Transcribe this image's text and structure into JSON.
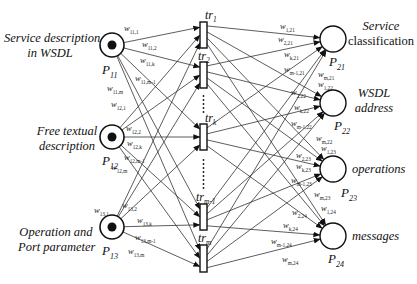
{
  "diagram": {
    "type": "petri-net",
    "colors": {
      "stroke": "#111111",
      "token": "#111111",
      "background": "#ffffff"
    },
    "input_places": [
      {
        "id": "P11",
        "base": "P",
        "sub": "11",
        "desc_lines": [
          "Service description",
          "in WSDL"
        ],
        "cx": 112,
        "cy": 45,
        "token": true
      },
      {
        "id": "P12",
        "base": "P",
        "sub": "12",
        "desc_lines": [
          "Free textual",
          "description"
        ],
        "cx": 112,
        "cy": 137,
        "token": true
      },
      {
        "id": "P13",
        "base": "P",
        "sub": "13",
        "desc_lines": [
          "Operation and",
          "Port parameter"
        ],
        "cx": 112,
        "cy": 227,
        "token": true
      }
    ],
    "transitions": [
      {
        "id": "tr1",
        "base": "tr",
        "sub": "1",
        "x": 200,
        "y": 22,
        "h": 26
      },
      {
        "id": "tr2",
        "base": "tr",
        "sub": "2",
        "x": 200,
        "y": 62,
        "h": 26
      },
      {
        "id": "trk",
        "base": "tr",
        "sub": "k",
        "x": 200,
        "y": 124,
        "h": 26
      },
      {
        "id": "trm-1",
        "base": "tr",
        "sub": "m-1",
        "x": 200,
        "y": 204,
        "h": 26
      },
      {
        "id": "trm",
        "base": "tr",
        "sub": "m",
        "x": 200,
        "y": 245,
        "h": 27
      }
    ],
    "output_places": [
      {
        "id": "P21",
        "base": "P",
        "sub": "21",
        "desc_lines": [
          "Service",
          "classification"
        ],
        "cx": 333,
        "cy": 39
      },
      {
        "id": "P22",
        "base": "P",
        "sub": "22",
        "desc_lines": [
          "WSDL",
          "address"
        ],
        "cx": 333,
        "cy": 103
      },
      {
        "id": "P23",
        "base": "P",
        "sub": "23",
        "desc_lines": [
          "operations"
        ],
        "cx": 333,
        "cy": 169
      },
      {
        "id": "P24",
        "base": "P",
        "sub": "24",
        "desc_lines": [
          "messages"
        ],
        "cx": 333,
        "cy": 236
      }
    ],
    "input_weights": {
      "P11": [
        "w11,1",
        "w11,2",
        "w11,k",
        "w11,m-1",
        "w11,m"
      ],
      "P12": [
        "w12,1",
        "w12,2",
        "w12,k",
        "w12,m-1",
        "w12,m"
      ],
      "P13": [
        "w13,1",
        "w13,2",
        "w13,k",
        "w13,m-1",
        "w13,m"
      ]
    },
    "output_weights": {
      "P21": [
        "w1,21",
        "w2,21",
        "wk,21",
        "wm-1,21",
        "wm,21"
      ],
      "P22": [
        "w1,22",
        "w2,22",
        "wk,22",
        "wm-1,22",
        "wm,22"
      ],
      "P23": [
        "w1,23",
        "w2,23",
        "wk,23",
        "wm-1,23",
        "wm,23"
      ],
      "P24": [
        "w1,24",
        "w2,24",
        "wk,24",
        "wm-1,24",
        "wm,24"
      ]
    },
    "ellipsis": "⋮"
  },
  "labels": {
    "p11_desc_1": "Service description",
    "p11_desc_2": "in WSDL",
    "p12_desc_1": "Free textual",
    "p12_desc_2": "description",
    "p13_desc_1": "Operation and",
    "p13_desc_2": "Port parameter",
    "p21_desc_1": "Service",
    "p21_desc_2": "classification",
    "p22_desc_1": "WSDL",
    "p22_desc_2": "address",
    "p23_desc_1": "operations",
    "p24_desc_1": "messages",
    "P": "P",
    "tr": "tr",
    "w": "w",
    "sub": {
      "11": "11",
      "12": "12",
      "13": "13",
      "21": "21",
      "22": "22",
      "23": "23",
      "24": "24",
      "t1": "1",
      "t2": "2",
      "tk": "k",
      "tm1": "m-1",
      "tm": "m",
      "w11_1": "11,1",
      "w11_2": "11,2",
      "w11_k": "11,k",
      "w11_m1": "11,m-1",
      "w11_m": "11,m",
      "w12_1": "12,1",
      "w12_2": "12,2",
      "w12_k": "12,k",
      "w12_m1": "12,m-1",
      "w12_m": "12,m",
      "w13_1": "13,1",
      "w13_2": "13,2",
      "w13_k": "13,k",
      "w13_m1": "13,m-1",
      "w13_m": "13,m",
      "w1_21": "1,21",
      "w2_21": "2,21",
      "wk_21": "k,21",
      "wm1_21": "m-1,21",
      "wm_21": "m,21",
      "w1_22": "1,22",
      "w2_22": "2,22",
      "wk_22": "k,22",
      "wm1_22": "m-1,22",
      "wm_22": "m,22",
      "w1_23": "1,23",
      "w2_23": "2,23",
      "wk_23": "k,23",
      "wm1_23": "m-1,23",
      "wm_23": "m,23",
      "w1_24": "1,24",
      "w2_24": "2,24",
      "wk_24": "k,24",
      "wm1_24": "m-1,24",
      "wm_24": "m,24"
    }
  }
}
